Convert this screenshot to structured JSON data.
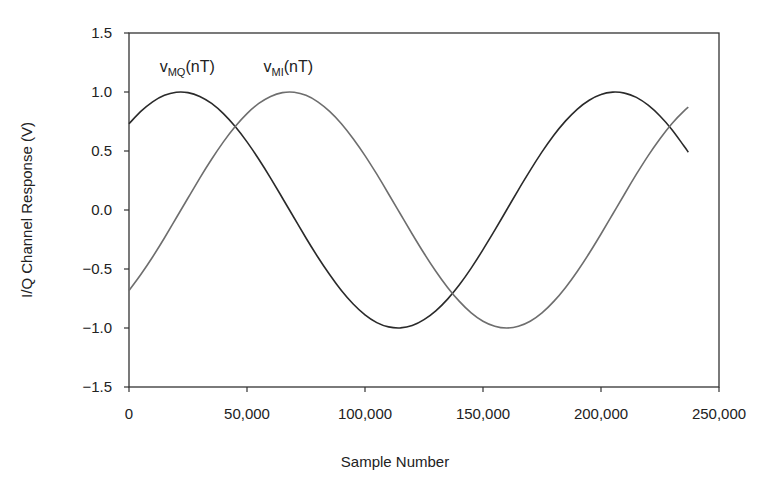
{
  "chart_data": {
    "type": "line",
    "title": "",
    "xlabel": "Sample Number",
    "ylabel": "I/Q Channel Response (V)",
    "xlim": [
      0,
      250000
    ],
    "ylim": [
      -1.5,
      1.5
    ],
    "xticks": [
      0,
      50000,
      100000,
      150000,
      200000,
      250000
    ],
    "xtick_labels": [
      "0",
      "50,000",
      "100,000",
      "150,000",
      "200,000",
      "250,000"
    ],
    "yticks": [
      1.5,
      1.0,
      0.5,
      0.0,
      -0.5,
      -1.0,
      -1.5
    ],
    "ytick_labels": [
      "1.5",
      "1.0",
      "0.5",
      "0.0",
      "−0.5",
      "−1.0",
      "−1.5"
    ],
    "grid": false,
    "legend": "inline labels near top-left of curves",
    "x": [
      0,
      5000,
      10000,
      15000,
      20000,
      25000,
      30000,
      35000,
      40000,
      45000,
      50000,
      55000,
      60000,
      65000,
      70000,
      75000,
      80000,
      85000,
      90000,
      95000,
      100000,
      105000,
      110000,
      115000,
      120000,
      125000,
      130000,
      135000,
      140000,
      145000,
      150000,
      155000,
      160000,
      165000,
      170000,
      175000,
      180000,
      185000,
      190000,
      195000,
      200000,
      205000,
      210000,
      215000,
      220000,
      225000,
      230000,
      235000,
      237000
    ],
    "series": [
      {
        "name": "vMQ(nT)",
        "label_main": "v",
        "label_sub": "MQ",
        "label_tail": "(nT)",
        "color": "#2a2a2a",
        "label_pos": [
          13000,
          1.22
        ],
        "values": [
          0.731,
          0.836,
          0.917,
          0.972,
          0.998,
          0.995,
          0.963,
          0.903,
          0.817,
          0.707,
          0.577,
          0.43,
          0.27,
          0.102,
          -0.068,
          -0.237,
          -0.398,
          -0.547,
          -0.682,
          -0.797,
          -0.888,
          -0.954,
          -0.991,
          -0.999,
          -0.979,
          -0.93,
          -0.855,
          -0.755,
          -0.634,
          -0.492,
          -0.336,
          -0.171,
          0.0,
          0.171,
          0.336,
          0.492,
          0.634,
          0.755,
          0.855,
          0.93,
          0.979,
          0.999,
          0.991,
          0.954,
          0.888,
          0.797,
          0.682,
          0.547,
          0.49
        ]
      },
      {
        "name": "vMI(nT)",
        "label_main": "v",
        "label_sub": "MI",
        "label_tail": "(nT)",
        "color": "#6e6e6e",
        "label_pos": [
          57000,
          1.22
        ],
        "values": [
          -0.682,
          -0.547,
          -0.398,
          -0.237,
          -0.068,
          0.102,
          0.27,
          0.43,
          0.577,
          0.707,
          0.817,
          0.903,
          0.963,
          0.995,
          0.998,
          0.972,
          0.917,
          0.836,
          0.731,
          0.604,
          0.461,
          0.303,
          0.136,
          -0.034,
          -0.203,
          -0.367,
          -0.519,
          -0.656,
          -0.775,
          -0.871,
          -0.942,
          -0.985,
          -1.0,
          -0.985,
          -0.942,
          -0.871,
          -0.775,
          -0.656,
          -0.519,
          -0.367,
          -0.203,
          -0.034,
          0.136,
          0.303,
          0.461,
          0.604,
          0.731,
          0.836,
          0.871
        ]
      }
    ]
  }
}
